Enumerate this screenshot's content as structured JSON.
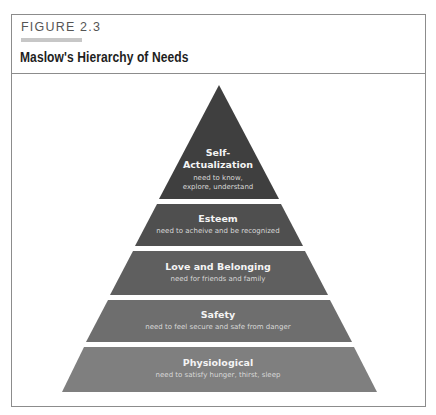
{
  "figure": {
    "label": "FIGURE 2.3",
    "title": "Maslow's Hierarchy of Needs"
  },
  "colors": {
    "tier1": "#3f3f3f",
    "tier2": "#4f4f4f",
    "tier3": "#5f5f5f",
    "tier4": "#6e6e6e",
    "tier5": "#7f7f7f",
    "border": "#8c8c8c",
    "label_bar": "#c7c7c7"
  },
  "tiers": [
    {
      "name_line1": "Self-",
      "name_line2": "Actualization",
      "desc_line1": "need to know,",
      "desc_line2": "explore, understand"
    },
    {
      "name": "Esteem",
      "desc": "need to acheive and be recognized"
    },
    {
      "name": "Love and Belonging",
      "desc": "need for friends and family"
    },
    {
      "name": "Safety",
      "desc": "need to feel secure and safe from danger"
    },
    {
      "name": "Physiological",
      "desc": "need to satisfy hunger, thirst, sleep"
    }
  ]
}
